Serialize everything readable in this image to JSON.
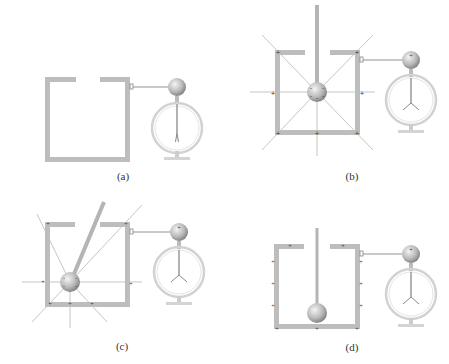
{
  "figure": {
    "colors": {
      "pail": "#bdbdbd",
      "field_line": "#9a9a9a",
      "charge_mark": "#333333",
      "ball_light": "#f2f2f2",
      "ball_dark": "#8a8a8a",
      "electroscope_ring": "#cfcfcf"
    },
    "panels": [
      {
        "id": "a",
        "label": "(a)",
        "description": "Uncharged pail connected to electroscope; leaves closed"
      },
      {
        "id": "b",
        "label": "(b)",
        "description": "Charged ball lowered on rod to center of pail; induced charges on walls, field lines radiate; electroscope leaves diverge"
      },
      {
        "id": "c",
        "label": "(c)",
        "description": "Charged ball moved off-center near lower-left wall; field lines redistribute; electroscope leaves unchanged"
      },
      {
        "id": "d",
        "label": "(d)",
        "description": "Ball touches bottom of pail; charge transferred to outer surface; electroscope leaves remain diverged"
      }
    ]
  }
}
